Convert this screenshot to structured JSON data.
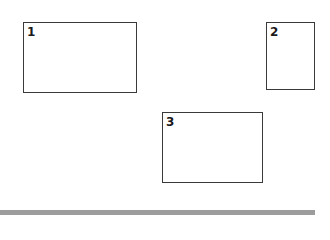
{
  "diagram": {
    "boxes": [
      {
        "label": "1"
      },
      {
        "label": "2"
      },
      {
        "label": "3"
      }
    ]
  },
  "colors": {
    "border": "#3a3a3a",
    "bottom_bar": "#9c9c9c",
    "background": "#ffffff"
  }
}
